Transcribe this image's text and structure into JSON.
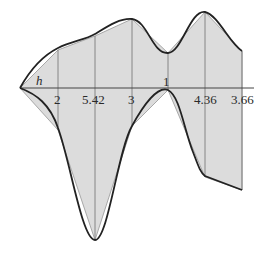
{
  "diagram": {
    "type": "trapezoid-rule-area-approximation",
    "axis": {
      "y": 88,
      "x_start": 20,
      "x_end": 254
    },
    "step_label": "h",
    "ordinate_labels": [
      "2",
      "5.42",
      "3",
      "1",
      "4.36",
      "3.66"
    ],
    "colors": {
      "fill": "#dcdcdc",
      "curve": "#222222",
      "chord": "#9a9a9a",
      "ordinate": "#7a7a7a",
      "axis": "#444444"
    },
    "nodes_x": [
      20,
      58,
      95,
      132,
      168,
      205,
      242
    ],
    "upper_y": [
      88,
      50,
      36,
      19,
      53,
      12,
      51
    ],
    "lower_y": [
      88,
      130,
      240,
      126,
      90,
      177,
      190
    ]
  }
}
